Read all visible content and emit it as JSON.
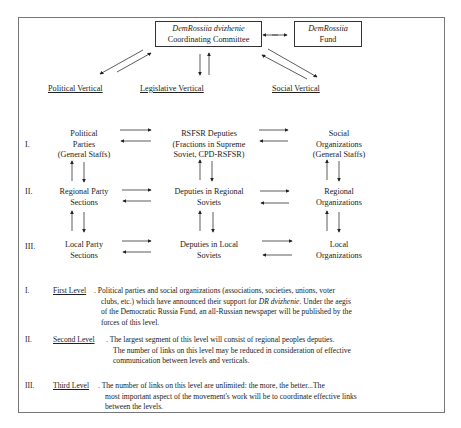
{
  "top": {
    "committee": {
      "line1": "DemRossiia dvizhenie",
      "line2": "Coordinating Committee"
    },
    "fund": {
      "line1": "DemRossiia",
      "line2": "Fund"
    },
    "verticals": [
      "Political Vertical",
      "Legislative Vertical",
      "Social Vertical"
    ]
  },
  "levels": [
    {
      "numeral": "I.",
      "nodes": [
        {
          "lines": [
            "Political",
            "Parties",
            "(General Staffs)"
          ]
        },
        {
          "lines": [
            "RSFSR Deputies",
            "(Fractions in Supreme",
            "Soviet, CPD-RSFSR)"
          ]
        },
        {
          "lines": [
            "Social",
            "Organizations",
            "(General Staffs)"
          ]
        }
      ]
    },
    {
      "numeral": "II.",
      "nodes": [
        {
          "lines": [
            "Regional Party",
            "Sections"
          ]
        },
        {
          "lines": [
            "Deputies in Regional",
            "Soviets"
          ]
        },
        {
          "lines": [
            "Regional",
            "Organizations"
          ]
        }
      ]
    },
    {
      "numeral": "III.",
      "nodes": [
        {
          "lines": [
            "Local Party",
            "Sections"
          ]
        },
        {
          "lines": [
            "Deputies in Local",
            "Soviets"
          ]
        },
        {
          "lines": [
            "Local",
            "Organizations"
          ]
        }
      ]
    }
  ],
  "descriptions": [
    {
      "numeral": "I.",
      "heading": "First Level",
      "lines": [
        ". Political parties and social organizations (associations, societies, unions, voter",
        "clubs, etc.) which have announced their support for ",
        "of the Democratic Russia Fund, an all-Russian newspaper will be published by the",
        "forces of this level."
      ],
      "italic_term": "DR dvizhenie",
      "after_italic": ".  Under the aegis"
    },
    {
      "numeral": "II.",
      "heading": "Second Level",
      "lines": [
        ". The largest segment of this level will consist of regional peoples deputies.",
        "The number of links on this level may be reduced in consideration of effective",
        "communication between levels and verticals."
      ]
    },
    {
      "numeral": "III.",
      "heading": "Third Level",
      "lines": [
        ". The number of links on this level are unlimited: the more, the better...The",
        "most important aspect of the movement's work will be to coordinate effective links",
        "between the levels."
      ]
    }
  ]
}
